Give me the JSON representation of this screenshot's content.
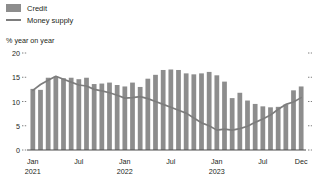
{
  "legend": {
    "items": [
      {
        "label": "Credit",
        "marker": "bar-swatch-icon",
        "color": "#8d8d8d"
      },
      {
        "label": "Money supply",
        "marker": "line-swatch-icon",
        "color": "#7d7d7d"
      }
    ]
  },
  "axis_title": "% year on year",
  "chart_data": {
    "type": "bar",
    "title": "",
    "subtitle": "",
    "xlabel": "",
    "ylabel": "% year on year",
    "ylim": [
      0,
      20
    ],
    "yticks": [
      0,
      5,
      10,
      15,
      20
    ],
    "ytick_labels": [
      "0",
      "5",
      "10",
      "15",
      "20"
    ],
    "grid": false,
    "legend_position": "top-left",
    "x": [
      "Jan 2021",
      "Feb 2021",
      "Mar 2021",
      "Apr 2021",
      "May 2021",
      "Jun 2021",
      "Jul 2021",
      "Aug 2021",
      "Sep 2021",
      "Oct 2021",
      "Nov 2021",
      "Dec 2021",
      "Jan 2022",
      "Feb 2022",
      "Mar 2022",
      "Apr 2022",
      "May 2022",
      "Jun 2022",
      "Jul 2022",
      "Aug 2022",
      "Sep 2022",
      "Oct 2022",
      "Nov 2022",
      "Dec 2022",
      "Jan 2023",
      "Feb 2023",
      "Mar 2023",
      "Apr 2023",
      "May 2023",
      "Jun 2023",
      "Jul 2023",
      "Aug 2023",
      "Sep 2023",
      "Oct 2023",
      "Nov 2023",
      "Dec 2023"
    ],
    "xtick_labels": [
      {
        "label": "Jan",
        "year": "2021",
        "index": 0
      },
      {
        "label": "Jul",
        "year": "",
        "index": 6
      },
      {
        "label": "Jan",
        "year": "2022",
        "index": 12
      },
      {
        "label": "Jul",
        "year": "",
        "index": 18
      },
      {
        "label": "Jan",
        "year": "2023",
        "index": 24
      },
      {
        "label": "Jul",
        "year": "",
        "index": 30
      },
      {
        "label": "Dec",
        "year": "",
        "index": 35
      }
    ],
    "series": [
      {
        "name": "Credit",
        "type": "bar",
        "color": "#8d8d8d",
        "values": [
          12.6,
          12.4,
          14.9,
          15.1,
          14.8,
          14.9,
          14.6,
          14.9,
          13.6,
          13.7,
          13.9,
          13.4,
          13.1,
          13.9,
          13.0,
          14.7,
          15.5,
          16.5,
          16.6,
          16.5,
          15.8,
          15.6,
          15.8,
          16.1,
          15.4,
          14.1,
          10.7,
          11.8,
          10.2,
          9.5,
          9.0,
          8.8,
          8.9,
          9.4,
          12.3,
          13.1
        ]
      },
      {
        "name": "Money supply",
        "type": "line",
        "color": "#7d7d7d",
        "values": [
          12.3,
          13.5,
          14.4,
          15.2,
          14.6,
          14.0,
          13.4,
          13.2,
          12.5,
          12.2,
          11.8,
          11.3,
          10.7,
          10.8,
          11.0,
          10.6,
          10.0,
          9.4,
          8.8,
          8.2,
          7.6,
          6.6,
          5.6,
          5.0,
          4.1,
          4.3,
          4.1,
          4.4,
          4.9,
          5.7,
          6.4,
          7.2,
          8.4,
          9.4,
          9.9,
          10.8
        ]
      }
    ]
  }
}
